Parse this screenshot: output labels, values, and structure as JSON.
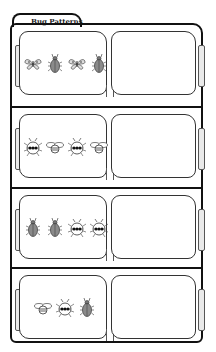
{
  "worksheet": {
    "title": "Bug Patterns",
    "rows": [
      {
        "pattern": [
          "moth",
          "beetle",
          "moth",
          "beetle"
        ],
        "answer": ""
      },
      {
        "pattern": [
          "ladybug",
          "bee",
          "ladybug",
          "bee"
        ],
        "answer": ""
      },
      {
        "pattern": [
          "beetle",
          "beetle",
          "ladybug",
          "ladybug"
        ],
        "answer": ""
      },
      {
        "pattern": [
          "bee",
          "ladybug",
          "beetle"
        ],
        "answer": ""
      }
    ]
  },
  "colors": {
    "line": "#111111",
    "beetle_fill": "#8a8a8a",
    "paper": "#ffffff"
  }
}
